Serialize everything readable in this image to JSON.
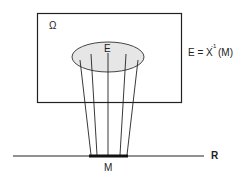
{
  "diagram": {
    "labels": {
      "omega": "Ω",
      "E": "E",
      "equation_lhs": "E = X",
      "equation_sup": "-1",
      "equation_rhs": "(M)",
      "M": "M",
      "R": "R"
    },
    "colors": {
      "stroke": "#222222",
      "ellipse_fill": "#e6e6e6",
      "background": "#ffffff"
    }
  }
}
